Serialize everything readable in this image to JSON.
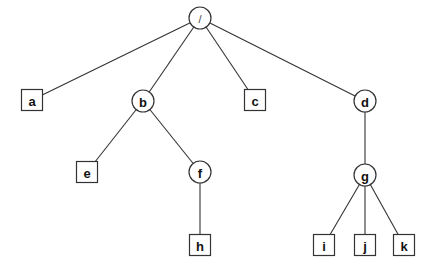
{
  "diagram": {
    "type": "tree",
    "nodes": [
      {
        "id": "root",
        "label": "/",
        "shape": "circle",
        "x": 200,
        "y": 18
      },
      {
        "id": "a",
        "label": "a",
        "shape": "square",
        "x": 32,
        "y": 100
      },
      {
        "id": "b",
        "label": "b",
        "shape": "circle",
        "x": 143,
        "y": 101
      },
      {
        "id": "c",
        "label": "c",
        "shape": "square",
        "x": 255,
        "y": 100
      },
      {
        "id": "d",
        "label": "d",
        "shape": "circle",
        "x": 365,
        "y": 101
      },
      {
        "id": "e",
        "label": "e",
        "shape": "square",
        "x": 87,
        "y": 172
      },
      {
        "id": "f",
        "label": "f",
        "shape": "circle",
        "x": 200,
        "y": 172
      },
      {
        "id": "g",
        "label": "g",
        "shape": "circle",
        "x": 365,
        "y": 175
      },
      {
        "id": "h",
        "label": "h",
        "shape": "square",
        "x": 200,
        "y": 245
      },
      {
        "id": "i",
        "label": "i",
        "shape": "square",
        "x": 324,
        "y": 245
      },
      {
        "id": "j",
        "label": "j",
        "shape": "square",
        "x": 365,
        "y": 245
      },
      {
        "id": "k",
        "label": "k",
        "shape": "square",
        "x": 404,
        "y": 245
      }
    ],
    "edges": [
      [
        "root",
        "a"
      ],
      [
        "root",
        "b"
      ],
      [
        "root",
        "c"
      ],
      [
        "root",
        "d"
      ],
      [
        "b",
        "e"
      ],
      [
        "b",
        "f"
      ],
      [
        "f",
        "h"
      ],
      [
        "d",
        "g"
      ],
      [
        "g",
        "i"
      ],
      [
        "g",
        "j"
      ],
      [
        "g",
        "k"
      ]
    ]
  }
}
